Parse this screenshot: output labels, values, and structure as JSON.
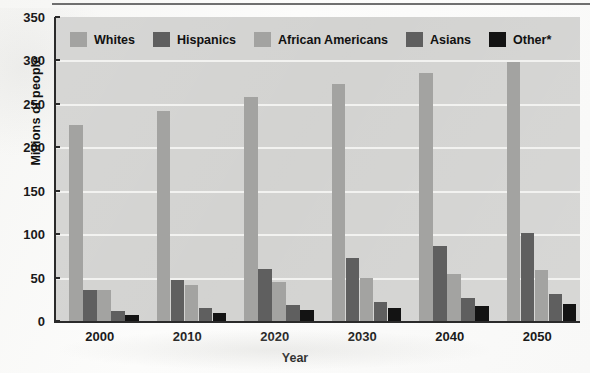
{
  "chart_data": {
    "type": "bar",
    "title": "",
    "xlabel": "Year",
    "ylabel": "Millions of people",
    "categories": [
      "2000",
      "2010",
      "2020",
      "2030",
      "2040",
      "2050"
    ],
    "series": [
      {
        "name": "Whites",
        "color": "#a3a3a1",
        "values": [
          226,
          242,
          258,
          273,
          285,
          298
        ]
      },
      {
        "name": "Hispanics",
        "color": "#5f5f5f",
        "values": [
          36,
          47,
          60,
          72,
          86,
          101
        ]
      },
      {
        "name": "African Americans",
        "color": "#a3a3a1",
        "values": [
          36,
          41,
          45,
          49,
          54,
          59
        ]
      },
      {
        "name": "Asians",
        "color": "#5f5f5f",
        "values": [
          11,
          15,
          19,
          22,
          27,
          31
        ]
      },
      {
        "name": "Other*",
        "color": "#131313",
        "values": [
          7,
          9,
          13,
          15,
          17,
          20
        ]
      }
    ],
    "ylim": [
      0,
      350
    ],
    "yticks": [
      "0",
      "50",
      "100",
      "150",
      "200",
      "250",
      "300",
      "350"
    ],
    "ytick_values": [
      0,
      50,
      100,
      150,
      200,
      250,
      300,
      350
    ],
    "grid": true,
    "legend_position": "top-inside-left",
    "plot_background": "#d2d2d0",
    "gridline_color": "#f2f2f0",
    "axis_color": "#2a2a2a"
  },
  "legend": {
    "items": [
      {
        "label": "Whites",
        "color": "#a3a3a1"
      },
      {
        "label": "Hispanics",
        "color": "#5f5f5f"
      },
      {
        "label": "African Americans",
        "color": "#a3a3a1"
      },
      {
        "label": "Asians",
        "color": "#5f5f5f"
      },
      {
        "label": "Other*",
        "color": "#131313"
      }
    ]
  }
}
